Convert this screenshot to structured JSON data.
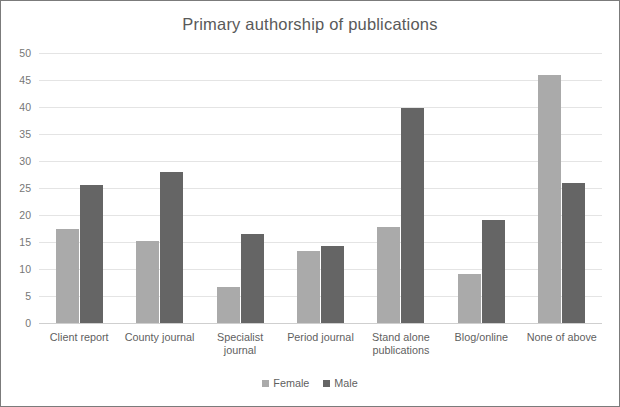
{
  "chart_data": {
    "type": "bar",
    "title": "Primary authorship of publications",
    "xlabel": "",
    "ylabel": "",
    "ylim": [
      0,
      50
    ],
    "yticks": [
      50,
      45,
      40,
      35,
      30,
      25,
      20,
      15,
      10,
      5,
      0
    ],
    "grid": true,
    "legend_position": "bottom",
    "categories": [
      "Client report",
      "County journal",
      "Specialist journal",
      "Period journal",
      "Stand alone publications",
      "Blog/online",
      "None of above"
    ],
    "category_lines": [
      [
        "Client report"
      ],
      [
        "County journal"
      ],
      [
        "Specialist journal"
      ],
      [
        "Period journal"
      ],
      [
        "Stand alone",
        "publications"
      ],
      [
        "Blog/online"
      ],
      [
        "None of above"
      ]
    ],
    "series": [
      {
        "name": "Female",
        "color": "#aaaaaa",
        "values": [
          17.4,
          15.2,
          6.7,
          13.3,
          17.7,
          9.1,
          46.0
        ]
      },
      {
        "name": "Male",
        "color": "#656565",
        "values": [
          25.6,
          28.0,
          16.5,
          14.2,
          39.9,
          19.0,
          26.0
        ]
      }
    ]
  },
  "legend": {
    "items": [
      {
        "label": "Female",
        "color": "#aaaaaa"
      },
      {
        "label": "Male",
        "color": "#656565"
      }
    ]
  }
}
